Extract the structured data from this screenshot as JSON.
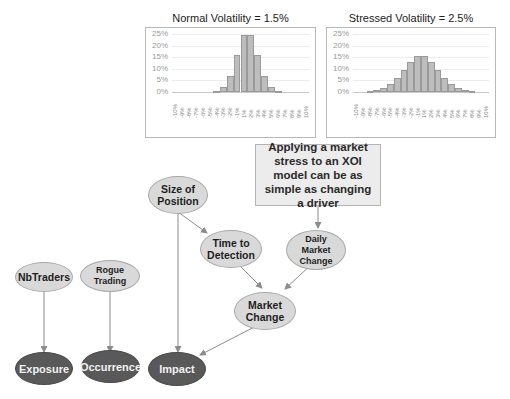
{
  "charts": [
    {
      "title": "Normal Volatility = 1.5%",
      "yticks": [
        "25%",
        "20%",
        "15%",
        "10%",
        "5%",
        "0%"
      ]
    },
    {
      "title": "Stressed Volatility = 2.5%",
      "yticks": [
        "25%",
        "20%",
        "15%",
        "10%",
        "5%",
        "0%"
      ]
    }
  ],
  "chart_data": [
    {
      "type": "bar",
      "title": "Normal Volatility = 1.5%",
      "xlabel": "",
      "ylabel": "",
      "categories": [
        "-10%",
        "-9%",
        "-8%",
        "-7%",
        "-6%",
        "-5%",
        "-4%",
        "-3%",
        "-2%",
        "-1%",
        "1%",
        "2%",
        "3%",
        "4%",
        "5%",
        "6%",
        "7%",
        "8%",
        "9%",
        "10%"
      ],
      "values": [
        0,
        0,
        0,
        0,
        0,
        0.1,
        0.5,
        2.1,
        6.7,
        16,
        24.6,
        24.6,
        16,
        6.7,
        2.1,
        0.5,
        0.1,
        0,
        0,
        0
      ],
      "ylim": [
        0,
        25
      ],
      "yticks": [
        "0%",
        "5%",
        "10%",
        "15%",
        "20%",
        "25%"
      ],
      "grid": true,
      "legend": "none"
    },
    {
      "type": "bar",
      "title": "Stressed Volatility = 2.5%",
      "xlabel": "",
      "ylabel": "",
      "categories": [
        "-10%",
        "-9%",
        "-8%",
        "-7%",
        "-6%",
        "-5%",
        "-4%",
        "-3%",
        "-2%",
        "-1%",
        "1%",
        "2%",
        "3%",
        "4%",
        "5%",
        "6%",
        "7%",
        "8%",
        "9%",
        "10%"
      ],
      "values": [
        0,
        0.1,
        0.3,
        0.7,
        1.6,
        3.3,
        5.9,
        9.5,
        13.1,
        15.5,
        15.5,
        13.1,
        9.5,
        5.9,
        3.3,
        1.6,
        0.7,
        0.3,
        0.1,
        0
      ],
      "ylim": [
        0,
        25
      ],
      "yticks": [
        "0%",
        "5%",
        "10%",
        "15%",
        "20%",
        "25%"
      ],
      "grid": true,
      "legend": "none"
    }
  ],
  "callout": {
    "text": "Applying a market stress to an XOI model can be as simple as changing a driver"
  },
  "nodes": {
    "size_of_position": "Size of Position",
    "time_to_detection": "Time to Detection",
    "daily_market_change": "Daily Market Change",
    "market_change": "Market Change",
    "nbtraders": "NbTraders",
    "rogue_trading": "Rogue Trading",
    "exposure": "Exposure",
    "occurrence": "Occurrence",
    "impact": "Impact"
  },
  "colors": {
    "light_node": "#d9d9d9",
    "dark_node": "#595959",
    "bar_fill": "#bdbdbd",
    "edge": "#8c8c8c"
  }
}
